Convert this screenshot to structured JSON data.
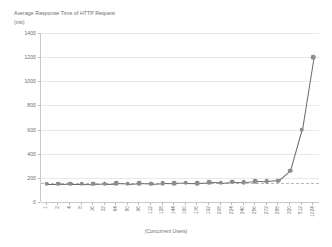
{
  "chart_data": {
    "type": "line",
    "title": "Average Response Time of HTTP Request",
    "title_unit": "(ms)",
    "xlabel": "(Concurrent Users)",
    "ylabel": "",
    "ylim": [
      0,
      1400
    ],
    "ytick_step": 200,
    "grid": true,
    "legend": "none",
    "marker": "circle",
    "line_color": "#6a6a6a",
    "marker_color": "#8d8d8d",
    "grid_color": "#e8e8e8",
    "axis_color": "#c9c9c9",
    "text_color": "#6f6f6f",
    "ytick_labels": [
      "1400",
      "1200",
      "1000",
      "800",
      "600",
      "400",
      "200",
      "0"
    ],
    "ytick_values": [
      1400,
      1200,
      1000,
      800,
      600,
      400,
      200,
      0
    ],
    "categories": [
      "1",
      "2",
      "4",
      "8",
      "16",
      "32",
      "64",
      "80",
      "96",
      "112",
      "128",
      "144",
      "160",
      "176",
      "192",
      "208",
      "224",
      "240",
      "256",
      "272",
      "288",
      "320",
      "512",
      "1024"
    ],
    "values": [
      150,
      150,
      152,
      152,
      150,
      153,
      155,
      150,
      156,
      152,
      158,
      155,
      160,
      158,
      162,
      160,
      168,
      165,
      172,
      170,
      178,
      260,
      600,
      1200
    ],
    "series": [
      {
        "name": "Average Response Time",
        "values": [
          150,
          150,
          152,
          152,
          150,
          153,
          155,
          150,
          156,
          152,
          158,
          155,
          160,
          158,
          162,
          160,
          168,
          165,
          172,
          170,
          178,
          260,
          600,
          1200
        ]
      }
    ]
  }
}
